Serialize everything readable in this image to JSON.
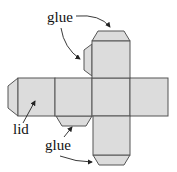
{
  "diagram": {
    "labels": {
      "glue_top": "glue",
      "lid": "lid",
      "glue_bottom": "glue"
    },
    "colors": {
      "face_fill": "#dcdcdc",
      "outline": "#555555",
      "text": "#111111"
    },
    "faces": [
      "left",
      "lid-face",
      "center",
      "right",
      "top",
      "bottom"
    ],
    "flaps": [
      "left-end-flap",
      "top-flap",
      "top-side-glue-flap",
      "under-lid-flap",
      "bottom-glue-flap"
    ]
  }
}
